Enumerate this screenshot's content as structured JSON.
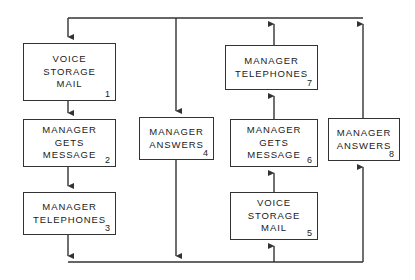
{
  "diagram": {
    "type": "flowchart",
    "line_color": "#333333",
    "box_border_color": "#333333",
    "background": "#ffffff",
    "nodes": [
      {
        "id": "node-1",
        "number": "1",
        "lines": [
          "VOICE",
          "STORAGE",
          "MAIL"
        ],
        "x": 23,
        "y": 43,
        "w": 93,
        "h": 58
      },
      {
        "id": "node-2",
        "number": "2",
        "lines": [
          "MANAGER",
          "GETS",
          "MESSAGE"
        ],
        "x": 23,
        "y": 119,
        "w": 93,
        "h": 48
      },
      {
        "id": "node-3",
        "number": "3",
        "lines": [
          "MANAGER",
          "TELEPHONES"
        ],
        "x": 23,
        "y": 192,
        "w": 93,
        "h": 43
      },
      {
        "id": "node-4",
        "number": "4",
        "lines": [
          "MANAGER",
          "ANSWERS"
        ],
        "x": 139,
        "y": 117,
        "w": 75,
        "h": 43
      },
      {
        "id": "node-5",
        "number": "5",
        "lines": [
          "VOICE",
          "STORAGE",
          "MAIL"
        ],
        "x": 230,
        "y": 192,
        "w": 88,
        "h": 48
      },
      {
        "id": "node-6",
        "number": "6",
        "lines": [
          "MANAGER",
          "GETS",
          "MESSAGE"
        ],
        "x": 230,
        "y": 119,
        "w": 88,
        "h": 48
      },
      {
        "id": "node-7",
        "number": "7",
        "lines": [
          "MANAGER",
          "TELEPHONES"
        ],
        "x": 225,
        "y": 45,
        "w": 93,
        "h": 45
      },
      {
        "id": "node-8",
        "number": "8",
        "lines": [
          "MANAGER",
          "ANSWERS"
        ],
        "x": 328,
        "y": 118,
        "w": 72,
        "h": 43
      }
    ],
    "connectors": [
      {
        "name": "top-rail",
        "from": "top-bus",
        "to": "node-1",
        "direction": "down"
      },
      {
        "name": "node1-to-node2",
        "from": "node-1",
        "to": "node-2",
        "direction": "down"
      },
      {
        "name": "node2-to-node3",
        "from": "node-2",
        "to": "node-3",
        "direction": "down"
      },
      {
        "name": "node3-to-bottom-rail",
        "from": "node-3",
        "to": "bottom-bus",
        "direction": "down"
      },
      {
        "name": "top-rail-to-node4",
        "from": "top-bus",
        "to": "node-4",
        "direction": "down"
      },
      {
        "name": "node4-to-bottom-rail",
        "from": "node-4",
        "to": "bottom-bus",
        "direction": "down"
      },
      {
        "name": "bottom-rail-to-node5",
        "from": "bottom-bus",
        "to": "node-5",
        "direction": "up"
      },
      {
        "name": "node5-to-node6",
        "from": "node-5",
        "to": "node-6",
        "direction": "up"
      },
      {
        "name": "node6-to-node7",
        "from": "node-6",
        "to": "node-7",
        "direction": "up"
      },
      {
        "name": "node7-to-top-rail",
        "from": "node-7",
        "to": "top-bus",
        "direction": "up"
      },
      {
        "name": "bottom-rail-to-node8",
        "from": "bottom-bus",
        "to": "node-8",
        "direction": "up"
      },
      {
        "name": "node8-to-top-rail",
        "from": "node-8",
        "to": "top-bus",
        "direction": "up"
      }
    ]
  }
}
